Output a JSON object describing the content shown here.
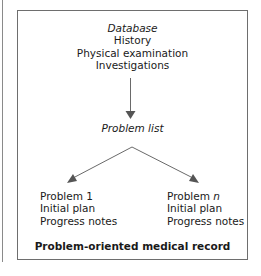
{
  "diagram": {
    "title": "Problem-oriented medical record",
    "database": {
      "heading": "Database",
      "items": [
        "History",
        "Physical examination",
        "Investigations"
      ]
    },
    "problem_list": "Problem list",
    "problems": [
      {
        "label_prefix": "Problem ",
        "label_index": "1",
        "items": [
          "Initial plan",
          "Progress notes"
        ]
      },
      {
        "label_prefix": "Problem ",
        "label_index": "n",
        "items": [
          "Initial plan",
          "Progress notes"
        ]
      }
    ],
    "colors": {
      "border": "#6e6e6e",
      "arrow": "#5a5a5a",
      "text": "#1a1a1a"
    }
  }
}
